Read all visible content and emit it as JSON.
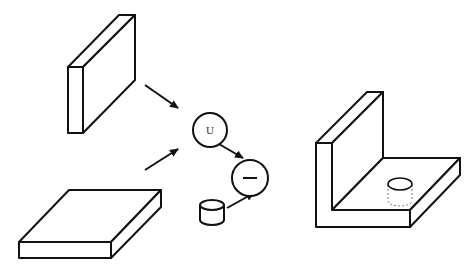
{
  "diagram": {
    "nodes": [
      {
        "id": "vertical-plate",
        "shape": "box"
      },
      {
        "id": "horizontal-plate",
        "shape": "box"
      },
      {
        "id": "union-op",
        "shape": "circle",
        "label": "U"
      },
      {
        "id": "cylinder",
        "shape": "cylinder"
      },
      {
        "id": "difference-op",
        "shape": "circle",
        "label": "—"
      },
      {
        "id": "l-bracket-result",
        "shape": "l-bracket-with-hole"
      }
    ],
    "edges": [
      {
        "from": "vertical-plate",
        "to": "union-op"
      },
      {
        "from": "horizontal-plate",
        "to": "union-op"
      },
      {
        "from": "union-op",
        "to": "difference-op"
      },
      {
        "from": "cylinder",
        "to": "difference-op"
      }
    ],
    "labels": {
      "union": "U",
      "difference": "—"
    },
    "colors": {
      "stroke": "#111111",
      "background": "#ffffff"
    }
  }
}
